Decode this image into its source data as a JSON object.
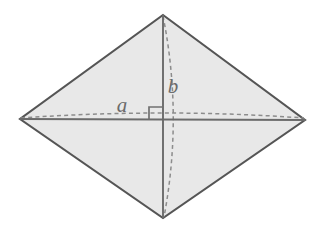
{
  "figure": {
    "name": "rhombus-diagonals",
    "canvas": {
      "width": 325,
      "height": 235
    },
    "colors": {
      "background": "#ffffff",
      "face_fill": "#e8e8e8",
      "outline_stroke": "#555555",
      "diagonal_stroke": "#6b6b6b",
      "hidden_edge_stroke": "#8c8c8c",
      "label_color": "#6b6b6b",
      "right_angle_stroke": "#707070"
    },
    "vertices": {
      "top": {
        "name": "top-vertex",
        "x": 163,
        "y": 15
      },
      "left": {
        "name": "left-vertex",
        "x": 20,
        "y": 119
      },
      "right": {
        "name": "right-vertex",
        "x": 305,
        "y": 120
      },
      "bottom": {
        "name": "bottom-vertex",
        "x": 163,
        "y": 218
      },
      "center": {
        "name": "diagonal-intersection",
        "x": 163,
        "y": 120
      }
    },
    "outline_path": "M 163 15 L 305 120 L 163 218 L 20 119 Z",
    "diagonals": [
      {
        "name": "horizontal-diagonal",
        "label": "a",
        "style": "solid",
        "path": "M 20 119 L 305 120"
      },
      {
        "name": "vertical-diagonal",
        "label": "b",
        "style": "solid",
        "path": "M 163 15 L 163 218"
      }
    ],
    "hidden_edges": [
      {
        "name": "horizontal-hidden-arc",
        "style": "dashed",
        "path": "M 21 118 Q 163 108 304 118"
      },
      {
        "name": "vertical-hidden-arc",
        "style": "dashed",
        "path": "M 163 16 Q 183 116 164 217"
      }
    ],
    "right_angle_marker": {
      "name": "right-angle-marker",
      "path": "M 149 120 L 149 107 L 163 107",
      "size": 13
    },
    "labels": {
      "a": {
        "text": "a",
        "x": 122,
        "y": 107
      },
      "b": {
        "text": "b",
        "x": 173,
        "y": 88
      }
    }
  }
}
